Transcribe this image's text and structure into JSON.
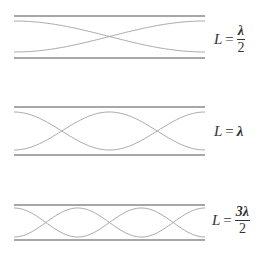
{
  "diagram": {
    "colors": {
      "wall": "#8a8a8a",
      "wave": "#a8a8a8",
      "text": "#333333"
    },
    "panels": [
      {
        "id": "half-wavelength",
        "label": {
          "var": "L",
          "eq": "=",
          "num": "λ",
          "den": "2",
          "fraction": true
        },
        "half_wavelengths": 1,
        "walls": {
          "top_y": 16,
          "bottom_y": 58
        },
        "wave": {
          "top_y": 21,
          "bottom_y": 52
        }
      },
      {
        "id": "full-wavelength",
        "label": {
          "var": "L",
          "eq": "=",
          "value": "λ",
          "fraction": false
        },
        "half_wavelengths": 2,
        "walls": {
          "top_y": 107,
          "bottom_y": 155
        },
        "wave": {
          "top_y": 112,
          "bottom_y": 150
        }
      },
      {
        "id": "three-half-wavelength",
        "label": {
          "var": "L",
          "eq": "=",
          "num": "3λ",
          "den": "2",
          "fraction": true
        },
        "half_wavelengths": 3,
        "walls": {
          "top_y": 205,
          "bottom_y": 240
        },
        "wave": {
          "top_y": 208,
          "bottom_y": 237
        }
      }
    ],
    "x_start": 14,
    "x_end": 205
  }
}
